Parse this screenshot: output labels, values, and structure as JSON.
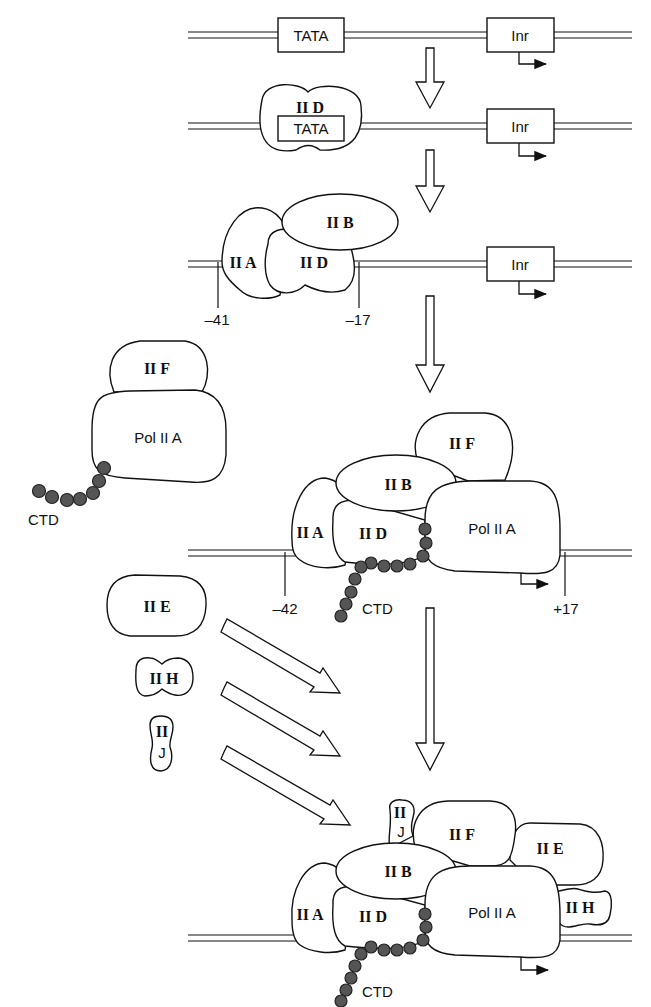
{
  "elements": {
    "tata": "TATA",
    "inr": "Inr",
    "ctd": "CTD"
  },
  "factors": {
    "iid": "II D",
    "iib": "II B",
    "iia": "II A",
    "iif": "II F",
    "iie": "II E",
    "iih": "II H",
    "iij_top": "II",
    "iij_bottom": "J",
    "pol": "Pol II A"
  },
  "positions": {
    "step3_left": "–41",
    "step3_right": "–17",
    "step4_left": "–42",
    "step4_right": "+17"
  },
  "colors": {
    "line": "#111111",
    "bead": "#555555",
    "background": "#ffffff"
  }
}
